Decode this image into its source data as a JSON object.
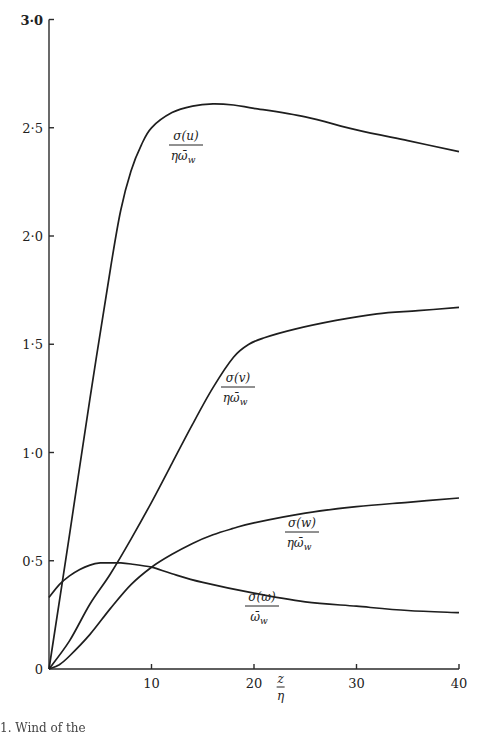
{
  "chart_data": {
    "type": "line",
    "title": "",
    "xlabel": "z/η",
    "ylabel": "",
    "xlim": [
      0,
      40
    ],
    "ylim": [
      0,
      3.0
    ],
    "grid": false,
    "legend": "inline curve labels",
    "x_ticks": [
      "10",
      "20",
      "30",
      "40"
    ],
    "y_ticks": [
      "0",
      "0·5",
      "1·0",
      "1·5",
      "2·0",
      "2·5",
      "3·0"
    ],
    "series": [
      {
        "name": "σ(u)/(η ω̄_w)",
        "label_num": "σ(u)",
        "label_den": "ηω̄",
        "label_sub": "w",
        "x": [
          0,
          2,
          4,
          6,
          7,
          8,
          9,
          10,
          12,
          14,
          16,
          18,
          20,
          25,
          30,
          35,
          40
        ],
        "y": [
          0,
          0.62,
          1.25,
          1.85,
          2.12,
          2.3,
          2.42,
          2.5,
          2.57,
          2.6,
          2.61,
          2.605,
          2.59,
          2.55,
          2.49,
          2.44,
          2.39
        ]
      },
      {
        "name": "σ(v)/(η ω̄_w)",
        "label_num": "σ(v)",
        "label_den": "ηω̄",
        "label_sub": "w",
        "x": [
          0,
          2,
          4,
          6,
          8,
          10,
          12,
          14,
          16,
          18,
          19.5,
          21,
          24,
          28,
          32,
          36,
          40
        ],
        "y": [
          0,
          0.13,
          0.3,
          0.44,
          0.6,
          0.77,
          0.95,
          1.13,
          1.3,
          1.44,
          1.5,
          1.53,
          1.57,
          1.61,
          1.64,
          1.655,
          1.67
        ]
      },
      {
        "name": "σ(w)/(η ω̄_w)",
        "label_num": "σ(w)",
        "label_den": "ηω̄",
        "label_sub": "w",
        "x": [
          0,
          1,
          2,
          4,
          6,
          8,
          10,
          12,
          14,
          16,
          18,
          20,
          25,
          30,
          35,
          40
        ],
        "y": [
          0,
          0.02,
          0.06,
          0.16,
          0.28,
          0.39,
          0.47,
          0.53,
          0.58,
          0.62,
          0.65,
          0.675,
          0.72,
          0.75,
          0.77,
          0.79
        ]
      },
      {
        "name": "σ(ω)/ω̄_w",
        "label_num": "σ(ω)",
        "label_den": "ω̄",
        "label_sub": "w",
        "x": [
          0,
          1,
          2,
          3,
          4,
          5,
          6,
          7,
          8,
          10,
          12,
          15,
          20,
          25,
          30,
          35,
          40
        ],
        "y": [
          0.33,
          0.39,
          0.43,
          0.46,
          0.48,
          0.49,
          0.49,
          0.49,
          0.485,
          0.47,
          0.44,
          0.4,
          0.35,
          0.31,
          0.29,
          0.27,
          0.26
        ]
      }
    ],
    "annotations": [
      {
        "text": "z/η",
        "position": "x-axis, between 20 and 30"
      }
    ]
  },
  "caption": "1. Wind    of the"
}
